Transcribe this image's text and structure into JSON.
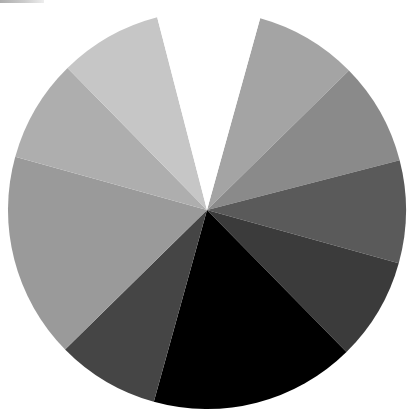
{
  "chart_data": {
    "type": "pie",
    "title": "",
    "start_angle_deg": 15.5,
    "direction": "clockwise",
    "center": [
      207,
      210
    ],
    "radius": 199,
    "categories": [
      "A",
      "B",
      "C",
      "D",
      "E",
      "F",
      "G",
      "H",
      "I",
      "gap"
    ],
    "values": [
      1,
      1,
      1,
      1,
      2,
      1,
      2,
      1,
      1,
      1
    ],
    "percentages": [
      8.3,
      8.3,
      8.3,
      8.3,
      16.7,
      8.3,
      16.7,
      8.3,
      8.3,
      8.3
    ],
    "colors": [
      "#a4a4a4",
      "#8a8a8a",
      "#5a5a5a",
      "#3b3b3b",
      "#000000",
      "#454545",
      "#9a9a9a",
      "#aeaeae",
      "#c6c6c6",
      "#ffffff"
    ],
    "legend": [],
    "labels_shown": false
  }
}
